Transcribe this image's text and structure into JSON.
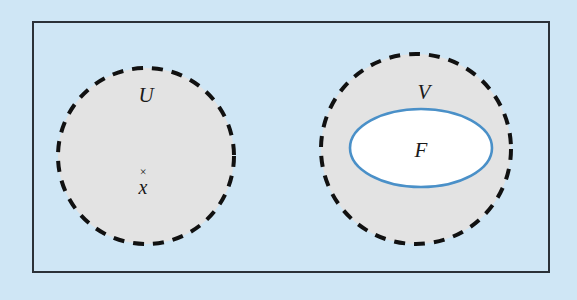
{
  "figure": {
    "type": "set-diagram",
    "caption": "",
    "background_color": "#cfe6f5",
    "frame": {
      "name": "outer-rectangle",
      "stroke_color": "#2b3138",
      "fill_color": "none",
      "x": 33,
      "y": 22,
      "width": 516,
      "height": 250,
      "stroke_width": 2
    },
    "regions": [
      {
        "id": "U",
        "label": "U",
        "shape": "circle",
        "style": "dashed",
        "stroke_color": "#111111",
        "fill_color": "#e3e3e3",
        "cx": 146,
        "cy": 156,
        "r": 88,
        "label_x": 146,
        "label_y": 102
      },
      {
        "id": "V",
        "label": "V",
        "shape": "circle",
        "style": "dashed",
        "stroke_color": "#111111",
        "fill_color": "#e3e3e3",
        "cx": 416,
        "cy": 149,
        "r": 95,
        "label_x": 424,
        "label_y": 99
      },
      {
        "id": "F",
        "label": "F",
        "shape": "ellipse",
        "style": "solid",
        "stroke_color": "#4a90c8",
        "fill_color": "#ffffff",
        "cx": 421,
        "cy": 148,
        "rx": 71,
        "ry": 39,
        "label_x": 421,
        "label_y": 157
      }
    ],
    "points": [
      {
        "id": "x",
        "label": "x",
        "marker": "×",
        "marker_x": 143,
        "marker_y": 172,
        "label_x": 143,
        "label_y": 192
      }
    ]
  }
}
